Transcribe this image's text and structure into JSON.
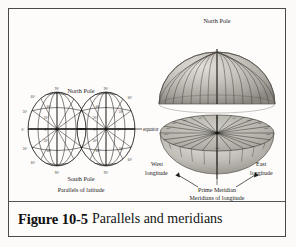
{
  "figure": {
    "caption_number": "Figure 10-5",
    "caption_text": "Parallels and meridians",
    "background_color": "#fdfcfa",
    "border_color": "#4a4a4a",
    "ink_color": "#1a1a1a"
  },
  "left_diagram": {
    "name": "parallels-of-latitude",
    "title_top": "North Pole",
    "title_bottom": "South Pole",
    "caption": "Parallels of latitude",
    "equator_label": "equator",
    "latitude_labels": [
      "90°",
      "60°",
      "30°",
      "0°",
      "30°",
      "60°",
      "90°"
    ],
    "degree_marks_left_globe": [
      "90°",
      "60°",
      "30°",
      "0°",
      "30°",
      "60°",
      "90°"
    ],
    "degree_marks_right_globe": [
      "90°",
      "60°",
      "30°",
      "0°",
      "30°",
      "60°",
      "90°"
    ],
    "interior_angle_labels": [
      "60°",
      "30°",
      "0°",
      "30°",
      "60°"
    ]
  },
  "right_diagram": {
    "name": "meridians-of-longitude",
    "title_top": "North Pole",
    "label_west": "West\nlongitude",
    "label_west_line1": "West",
    "label_west_line2": "longitude",
    "label_east_line1": "East",
    "label_east_line2": "longitude",
    "label_prime_meridian": "Prime Meridian",
    "caption": "Meridians of longitude",
    "longitude_ticks": [
      "0°",
      "30°",
      "60°",
      "90°",
      "120°",
      "150°",
      "180°",
      "150°",
      "120°",
      "90°",
      "60°",
      "30°"
    ],
    "meridian_count": 24,
    "shading": {
      "dome_light": "#d8d5d0",
      "dome_mid": "#b5b1ab",
      "dome_dark": "#8d8983",
      "bowl_light": "#d2cfc9",
      "bowl_dark": "#9b9791"
    }
  }
}
